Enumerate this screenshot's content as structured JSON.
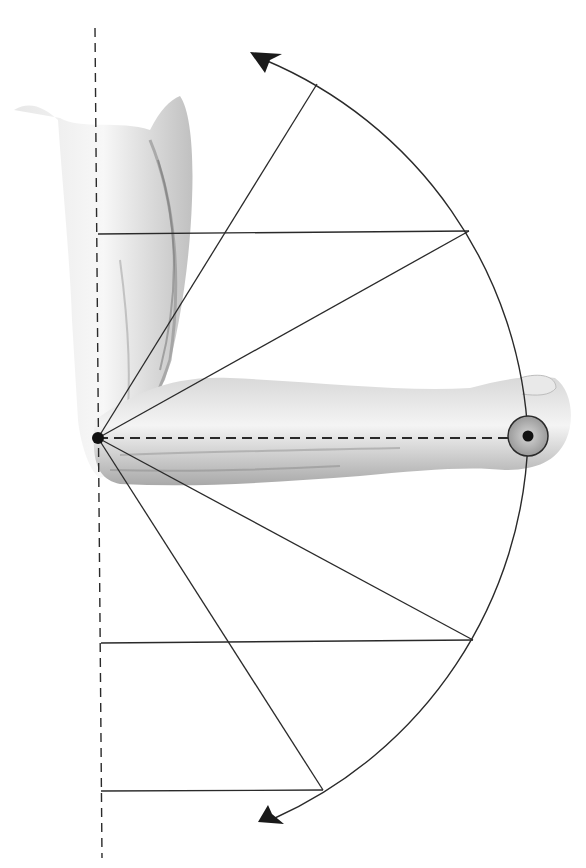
{
  "figure": {
    "colors": {
      "line": "#2a2a2a",
      "skin_light": "#ececec",
      "skin_mid": "#c8c8c8",
      "skin_dark": "#7a7a7a",
      "target_fill": "#b5b5b5",
      "background": "#ffffff"
    },
    "pivot": {
      "x": 98,
      "y": 438
    },
    "radius": 430,
    "reference_axis": "vertical dashed line through elbow",
    "forearm_axis": "horizontal dashed line from elbow to fist",
    "radial_lines_top": [
      {
        "x": 317,
        "y": 84
      },
      {
        "x": 469,
        "y": 231
      }
    ],
    "radial_lines_bottom": [
      {
        "x": 473,
        "y": 640
      },
      {
        "x": 323,
        "y": 790
      }
    ],
    "horizontal_projections_y": [
      233,
      642,
      790
    ],
    "arc_arrows": [
      "upper-arrowhead",
      "lower-arrowhead"
    ]
  }
}
